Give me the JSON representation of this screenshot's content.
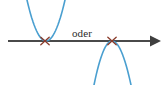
{
  "figure": {
    "width": 165,
    "height": 85,
    "background_color": "#ffffff",
    "connector_label": "oder"
  },
  "axis": {
    "name": "horizontal-number-line",
    "color": "#4a4a4a",
    "stroke_width": 2.0,
    "y": 41,
    "x_start": 8,
    "x_end": 152,
    "arrow_tip_x": 161,
    "arrow_head_half_height": 5.5,
    "arrow_head_length": 11
  },
  "curves": [
    {
      "id": "left-parabola",
      "label": "Nach oben geoeffnete Parabel",
      "orientation": "opens-up",
      "color": "#4a9fd0",
      "stroke_width": 1.6,
      "vertex_x": 46,
      "vertex_y": 41,
      "left_arm_x": 27,
      "right_arm_x": 65,
      "arm_end_y": 0,
      "touch_point_label": "doppelte Nullstelle"
    },
    {
      "id": "right-parabola",
      "label": "Nach unten geoeffnete Parabel",
      "orientation": "opens-down",
      "color": "#4a9fd0",
      "stroke_width": 1.6,
      "vertex_x": 112,
      "vertex_y": 41,
      "left_arm_x": 94,
      "right_arm_x": 131,
      "arm_end_y": 85,
      "touch_point_label": "doppelte Nullstelle"
    }
  ],
  "markers": [
    {
      "id": "left-root-marker",
      "glyph": "x",
      "color": "#8a3b2a",
      "x": 45,
      "y": 41,
      "size": 4.2,
      "stroke_width": 1.3
    },
    {
      "id": "right-root-marker",
      "glyph": "x",
      "color": "#8a3b2a",
      "x": 112,
      "y": 41,
      "size": 4.2,
      "stroke_width": 1.3
    }
  ],
  "connector": {
    "text": "oder",
    "x": 72,
    "y": 28,
    "font_size": 11,
    "color": "#2b2b2b"
  },
  "chart_data": {
    "type": "line",
    "xlabel": "",
    "ylabel": "",
    "grid": false,
    "legend": "none",
    "annotations": [
      "oder",
      "x",
      "x"
    ],
    "series": [
      {
        "name": "Parabel nach oben",
        "shape": "parabola-opens-up",
        "vertex": [
          46,
          41
        ],
        "tangent_to_axis": true,
        "points": [
          [
            27,
            0
          ],
          [
            33,
            16
          ],
          [
            39,
            29
          ],
          [
            44,
            39
          ],
          [
            46,
            41
          ],
          [
            48,
            39
          ],
          [
            54,
            28
          ],
          [
            60,
            14
          ],
          [
            65,
            0
          ]
        ]
      },
      {
        "name": "Parabel nach unten",
        "shape": "parabola-opens-down",
        "vertex": [
          112,
          41
        ],
        "tangent_to_axis": true,
        "points": [
          [
            94,
            85
          ],
          [
            99,
            68
          ],
          [
            104,
            54
          ],
          [
            109,
            44
          ],
          [
            112,
            41
          ],
          [
            115,
            44
          ],
          [
            120,
            54
          ],
          [
            126,
            69
          ],
          [
            131,
            85
          ]
        ]
      },
      {
        "name": "Zahlengerade",
        "shape": "axis-arrow-right",
        "points": [
          [
            8,
            41
          ],
          [
            161,
            41
          ]
        ]
      }
    ]
  }
}
